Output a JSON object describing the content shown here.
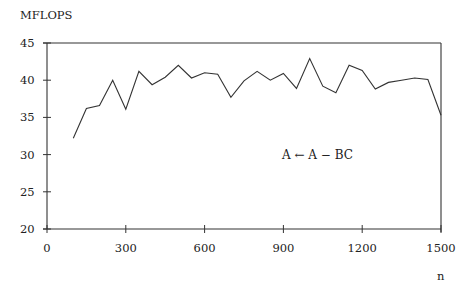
{
  "chart_data": {
    "type": "line",
    "title": "",
    "ylabel": "MFLOPS",
    "xlabel": "n",
    "annotation": "A ← A − BC",
    "xlim": [
      0,
      1500
    ],
    "ylim": [
      20,
      45
    ],
    "xticks": [
      0,
      300,
      600,
      900,
      1200,
      1500
    ],
    "yticks": [
      20,
      25,
      30,
      35,
      40,
      45
    ],
    "grid": false,
    "legend": null,
    "series": [
      {
        "name": "A ← A − BC",
        "x": [
          100,
          150,
          200,
          250,
          300,
          350,
          400,
          450,
          500,
          550,
          600,
          650,
          700,
          750,
          800,
          850,
          900,
          950,
          1000,
          1050,
          1100,
          1150,
          1200,
          1250,
          1300,
          1350,
          1400,
          1450,
          1500
        ],
        "values": [
          32.2,
          36.2,
          36.6,
          40.0,
          36.1,
          41.2,
          39.4,
          40.4,
          42.0,
          40.3,
          41.0,
          40.8,
          37.7,
          39.9,
          41.2,
          40.0,
          40.9,
          38.9,
          42.9,
          39.2,
          38.3,
          42.0,
          41.3,
          38.8,
          39.7,
          40.0,
          40.3,
          40.1,
          35.3
        ]
      }
    ]
  }
}
